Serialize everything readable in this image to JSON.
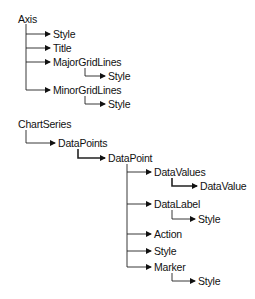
{
  "diagram": {
    "nodes": [
      {
        "id": "axis",
        "label": "Axis",
        "x": 18,
        "y": 13
      },
      {
        "id": "axis-style",
        "label": "Style",
        "x": 53,
        "y": 28
      },
      {
        "id": "axis-title",
        "label": "Title",
        "x": 53,
        "y": 42
      },
      {
        "id": "axis-major",
        "label": "MajorGridLines",
        "x": 53,
        "y": 56
      },
      {
        "id": "axis-major-style",
        "label": "Style",
        "x": 108,
        "y": 70
      },
      {
        "id": "axis-minor",
        "label": "MinorGridLines",
        "x": 53,
        "y": 84
      },
      {
        "id": "axis-minor-style",
        "label": "Style",
        "x": 108,
        "y": 98
      },
      {
        "id": "chartseries",
        "label": "ChartSeries",
        "x": 18,
        "y": 118
      },
      {
        "id": "datapoints",
        "label": "DataPoints",
        "x": 58,
        "y": 137
      },
      {
        "id": "datapoint",
        "label": "DataPoint",
        "x": 108,
        "y": 152
      },
      {
        "id": "datavalues",
        "label": "DataValues",
        "x": 154,
        "y": 166
      },
      {
        "id": "datavalue",
        "label": "DataValue",
        "x": 200,
        "y": 180
      },
      {
        "id": "datalabel",
        "label": "DataLabel",
        "x": 154,
        "y": 198
      },
      {
        "id": "datalabel-style",
        "label": "Style",
        "x": 198,
        "y": 213
      },
      {
        "id": "action",
        "label": "Action",
        "x": 154,
        "y": 228
      },
      {
        "id": "dp-style",
        "label": "Style",
        "x": 154,
        "y": 245
      },
      {
        "id": "marker",
        "label": "Marker",
        "x": 154,
        "y": 261
      },
      {
        "id": "marker-style",
        "label": "Style",
        "x": 198,
        "y": 275
      }
    ]
  }
}
